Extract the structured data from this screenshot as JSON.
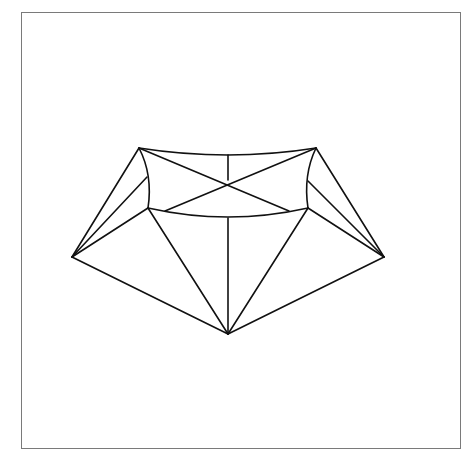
{
  "figure": {
    "stroke_color": "#111111",
    "frame_color": "#7a7a7a",
    "background": "#ffffff",
    "vertices": {
      "A_top_left": [
        139,
        148
      ],
      "B_top_right": [
        316,
        148
      ],
      "X_center_cross": [
        228,
        180
      ],
      "T_top_arc_mid": [
        228,
        155
      ],
      "C_inner_left": [
        148,
        208
      ],
      "D_inner_right": [
        308,
        208
      ],
      "M_inner_arc_mid": [
        228,
        218
      ],
      "E_far_left": [
        72,
        257
      ],
      "F_far_right": [
        384,
        257
      ],
      "G_bottom": [
        228,
        334
      ],
      "L_left_kink": [
        147,
        177
      ],
      "R_right_kink": [
        308,
        181
      ]
    }
  }
}
